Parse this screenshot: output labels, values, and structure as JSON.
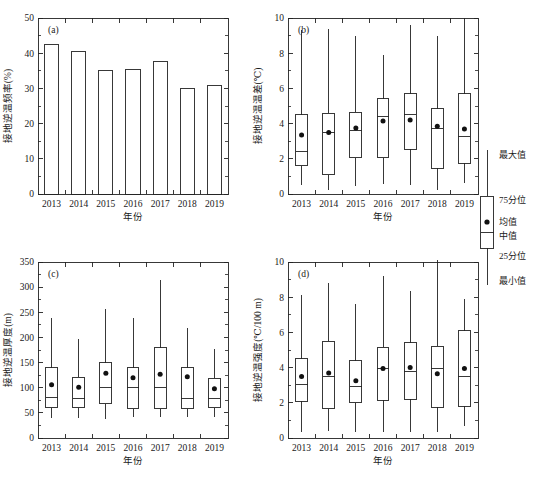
{
  "figure": {
    "caption": "年份",
    "panels_order": [
      "a",
      "b",
      "c",
      "d"
    ]
  },
  "legend": {
    "name": "boxplot-legend",
    "items": [
      {
        "key": "max",
        "label": "最大值"
      },
      {
        "key": "p75",
        "label": "75分位"
      },
      {
        "key": "mean",
        "label": "均值"
      },
      {
        "key": "median",
        "label": "中值"
      },
      {
        "key": "p25",
        "label": "25分位"
      },
      {
        "key": "min",
        "label": "最小值"
      }
    ]
  },
  "chart_data": [
    {
      "type": "bar",
      "panel": "(a)",
      "title": "",
      "xlabel": "年份",
      "ylabel": "接地逆温频率(%)",
      "categories": [
        "2013",
        "2014",
        "2015",
        "2016",
        "2017",
        "2018",
        "2019"
      ],
      "values": [
        42.5,
        40.6,
        35.0,
        35.4,
        37.7,
        30.0,
        30.7
      ],
      "ylim": [
        0,
        50
      ],
      "yticks": [
        0,
        10,
        20,
        30,
        40,
        50
      ],
      "grid": false
    },
    {
      "type": "box",
      "panel": "(b)",
      "title": "",
      "xlabel": "年份",
      "ylabel": "接地逆温温差(℃)",
      "categories": [
        "2013",
        "2014",
        "2015",
        "2016",
        "2017",
        "2018",
        "2019"
      ],
      "ylim": [
        0,
        10
      ],
      "yticks": [
        0,
        2,
        4,
        6,
        8,
        10
      ],
      "grid": false,
      "series": [
        {
          "name": "2013",
          "min": 0.5,
          "p25": 1.6,
          "median": 2.4,
          "mean": 3.35,
          "p75": 4.5,
          "max": 9.3
        },
        {
          "name": "2014",
          "min": 0.2,
          "p25": 1.1,
          "median": 3.5,
          "mean": 3.5,
          "p75": 4.6,
          "max": 9.4
        },
        {
          "name": "2015",
          "min": 0.45,
          "p25": 2.05,
          "median": 3.6,
          "mean": 3.75,
          "p75": 4.65,
          "max": 9.0
        },
        {
          "name": "2016",
          "min": 0.55,
          "p25": 2.05,
          "median": 4.4,
          "mean": 4.15,
          "p75": 5.4,
          "max": 7.9
        },
        {
          "name": "2017",
          "min": 0.5,
          "p25": 2.55,
          "median": 4.5,
          "mean": 4.2,
          "p75": 5.7,
          "max": 9.6
        },
        {
          "name": "2018",
          "min": 0.25,
          "p25": 1.45,
          "median": 3.75,
          "mean": 3.85,
          "p75": 4.85,
          "max": 9.0
        },
        {
          "name": "2019",
          "min": 0.6,
          "p25": 1.75,
          "median": 3.25,
          "mean": 3.7,
          "p75": 5.7,
          "max": 10.0
        }
      ]
    },
    {
      "type": "box",
      "panel": "(c)",
      "title": "",
      "xlabel": "年份",
      "ylabel": "接地逆温厚度(m)",
      "categories": [
        "2013",
        "2014",
        "2015",
        "2016",
        "2017",
        "2018",
        "2019"
      ],
      "ylim": [
        0,
        350
      ],
      "yticks": [
        0,
        50,
        100,
        150,
        200,
        250,
        300,
        350
      ],
      "grid": false,
      "series": [
        {
          "name": "2013",
          "min": 40,
          "p25": 60,
          "median": 80,
          "mean": 106,
          "p75": 140,
          "max": 238
        },
        {
          "name": "2014",
          "min": 40,
          "p25": 60,
          "median": 78,
          "mean": 101,
          "p75": 121,
          "max": 197
        },
        {
          "name": "2015",
          "min": 38,
          "p25": 68,
          "median": 100,
          "mean": 129,
          "p75": 150,
          "max": 257
        },
        {
          "name": "2016",
          "min": 42,
          "p25": 58,
          "median": 100,
          "mean": 120,
          "p75": 140,
          "max": 238
        },
        {
          "name": "2017",
          "min": 41,
          "p25": 58,
          "median": 101,
          "mean": 127,
          "p75": 179,
          "max": 314
        },
        {
          "name": "2018",
          "min": 42,
          "p25": 58,
          "median": 78,
          "mean": 122,
          "p75": 140,
          "max": 218
        },
        {
          "name": "2019",
          "min": 41,
          "p25": 60,
          "median": 79,
          "mean": 98,
          "p75": 119,
          "max": 177
        }
      ]
    },
    {
      "type": "box",
      "panel": "(d)",
      "title": "",
      "xlabel": "年份",
      "ylabel": "接地逆温强度(℃/100 m)",
      "categories": [
        "2013",
        "2014",
        "2015",
        "2016",
        "2017",
        "2018",
        "2019"
      ],
      "ylim": [
        0,
        10
      ],
      "yticks": [
        0,
        2,
        4,
        6,
        8,
        10
      ],
      "grid": false,
      "series": [
        {
          "name": "2013",
          "min": 0.35,
          "p25": 2.1,
          "median": 3.05,
          "mean": 3.5,
          "p75": 4.5,
          "max": 8.15
        },
        {
          "name": "2014",
          "min": 0.4,
          "p25": 1.65,
          "median": 3.5,
          "mean": 3.7,
          "p75": 5.5,
          "max": 8.8
        },
        {
          "name": "2015",
          "min": 0.35,
          "p25": 2.0,
          "median": 2.95,
          "mean": 3.25,
          "p75": 4.4,
          "max": 7.6
        },
        {
          "name": "2016",
          "min": 0.35,
          "p25": 2.15,
          "median": 3.95,
          "mean": 3.95,
          "p75": 5.15,
          "max": 9.2
        },
        {
          "name": "2017",
          "min": 0.35,
          "p25": 2.2,
          "median": 3.8,
          "mean": 4.0,
          "p75": 5.4,
          "max": 8.35
        },
        {
          "name": "2018",
          "min": 0.35,
          "p25": 1.75,
          "median": 3.95,
          "mean": 3.65,
          "p75": 5.2,
          "max": 10.1
        },
        {
          "name": "2019",
          "min": 0.7,
          "p25": 1.8,
          "median": 3.5,
          "mean": 3.95,
          "p75": 6.1,
          "max": 7.9
        }
      ]
    }
  ]
}
